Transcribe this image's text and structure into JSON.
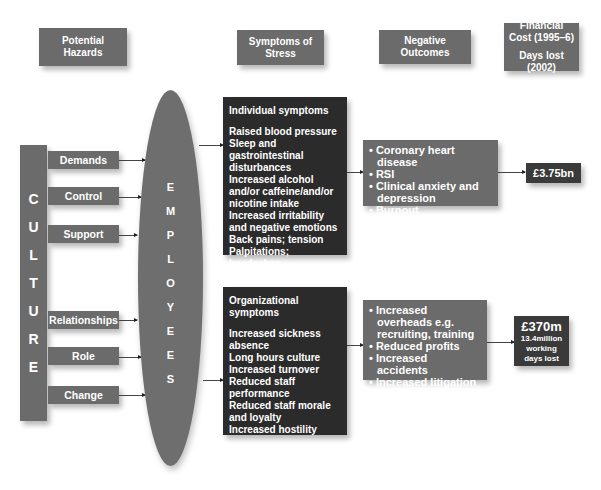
{
  "headers": {
    "hazards": [
      "Potential",
      "Hazards"
    ],
    "symptoms": [
      "Symptoms of",
      "Stress"
    ],
    "outcomes": [
      "Negative",
      "Outcomes"
    ],
    "financial": [
      "Financial",
      "Cost (1995–6)",
      "Days lost (2002)"
    ]
  },
  "culture": {
    "letters": [
      "C",
      "U",
      "L",
      "T",
      "U",
      "R",
      "E"
    ]
  },
  "hazards": [
    "Demands",
    "Control",
    "Support",
    "Relationships",
    "Role",
    "Change"
  ],
  "employees": {
    "letters": [
      "E",
      "M",
      "P",
      "L",
      "O",
      "Y",
      "E",
      "E",
      "S"
    ]
  },
  "individual": {
    "title": "Individual symptoms",
    "items": [
      "Raised blood pressure",
      "Sleep and gastrointestinal disturbances",
      "Increased alcohol and/or caffeine/and/or nicotine intake",
      "Increased irritability and negative emotions",
      "Back pains; tension",
      "Palpitations; headaches"
    ]
  },
  "organizational": {
    "title": "Organizational symptoms",
    "items": [
      "Increased sickness absence",
      "Long hours culture",
      "Increased turnover",
      "Reduced staff performance",
      "Reduced staff morale and loyalty",
      "Increased hostility"
    ]
  },
  "individual_outcomes": [
    "• Coronary heart disease",
    "• RSI",
    "• Clinical anxiety and depression",
    "• Burnout"
  ],
  "organizational_outcomes": [
    "• Increased overheads e.g. recruiting, training",
    "• Reduced profits",
    "• Increased accidents",
    "• Increased litigation"
  ],
  "costs": {
    "individual": "£3.75bn",
    "organizational": "£370m",
    "organizational_days": [
      "13.4million",
      "working",
      "days lost"
    ]
  }
}
